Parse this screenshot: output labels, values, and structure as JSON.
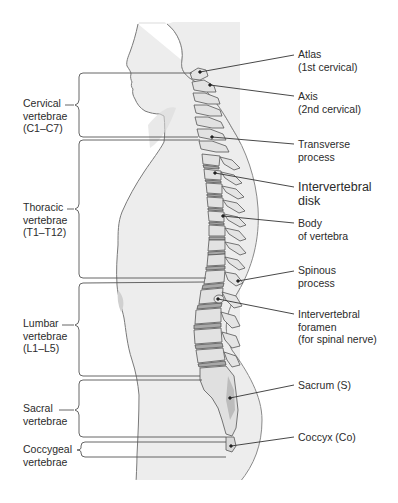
{
  "figure": {
    "colors": {
      "body_fill": "#ececec",
      "body_outline": "#8a8a8a",
      "bone_fill": "#e2e2e2",
      "bone_outline": "#555555",
      "disk_fill": "#a8a8a8",
      "sacrum_shade": "#b8b8b8",
      "line": "#333333",
      "text": "#2b2b2b"
    }
  },
  "regions": [
    {
      "id": "cervical",
      "lines": [
        "Cervical",
        "vertebrae",
        "(C1–C7)"
      ]
    },
    {
      "id": "thoracic",
      "lines": [
        "Thoracic",
        "vertebrae",
        "(T1–T12)"
      ]
    },
    {
      "id": "lumbar",
      "lines": [
        "Lumbar",
        "vertebrae",
        "(L1–L5)"
      ]
    },
    {
      "id": "sacral",
      "lines": [
        "Sacral",
        "vertebrae"
      ]
    },
    {
      "id": "coccygeal",
      "lines": [
        "Coccygeal",
        "vertebrae"
      ]
    }
  ],
  "callouts": [
    {
      "id": "atlas",
      "lines": [
        "Atlas",
        "(1st cervical)"
      ]
    },
    {
      "id": "axis",
      "lines": [
        "Axis",
        "(2nd cervical)"
      ]
    },
    {
      "id": "transverse-process",
      "lines": [
        "Transverse",
        "process"
      ]
    },
    {
      "id": "intervertebral-disk",
      "lines": [
        "Intervertebral",
        "disk"
      ]
    },
    {
      "id": "body-of-vertebra",
      "lines": [
        "Body",
        "of vertebra"
      ]
    },
    {
      "id": "spinous-process",
      "lines": [
        "Spinous",
        "process"
      ]
    },
    {
      "id": "intervertebral-foramen",
      "lines": [
        "Intervertebral",
        "foramen",
        "(for spinal nerve)"
      ]
    },
    {
      "id": "sacrum",
      "lines": [
        "Sacrum (S)"
      ]
    },
    {
      "id": "coccyx",
      "lines": [
        "Coccyx (Co)"
      ]
    }
  ]
}
